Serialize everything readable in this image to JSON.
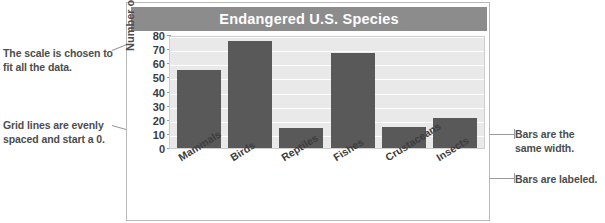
{
  "chart_data": {
    "type": "bar",
    "title": "Endangered U.S. Species",
    "xlabel": "",
    "ylabel": "Number of species",
    "categories": [
      "Mammals",
      "Birds",
      "Reptiles",
      "Fishes",
      "Crustaceans",
      "Insects"
    ],
    "values": [
      55,
      76,
      14,
      67,
      15,
      21
    ],
    "ylim": [
      0,
      80
    ],
    "yticks": [
      80,
      70,
      60,
      50,
      40,
      30,
      20,
      10,
      0
    ],
    "grid": true,
    "legend": "none",
    "bar_color": "#595959",
    "plot_background": "#e9e9e9",
    "title_band_color": "#8c8c8c",
    "title_text_color": "#ffffff"
  },
  "annotations": {
    "scale_note": "The scale is chosen to fit all the data.",
    "grid_note": "Grid lines are evenly spaced and start a 0.",
    "width_note": "Bars are the same width.",
    "label_note": "Bars are labeled."
  }
}
